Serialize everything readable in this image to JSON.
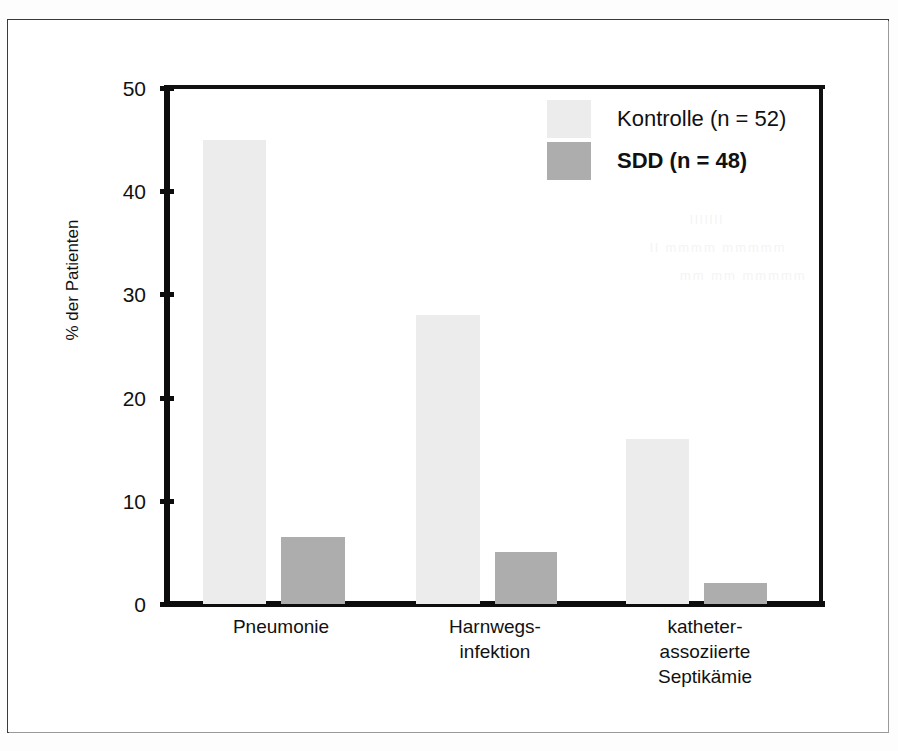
{
  "chart_data": {
    "type": "bar",
    "title": "",
    "xlabel": "",
    "ylabel": "% der Patienten",
    "ylim": [
      0,
      50
    ],
    "yticks": [
      0,
      10,
      20,
      30,
      40,
      50
    ],
    "ytick_labels": [
      "0",
      "10",
      "20",
      "30",
      "40",
      "50"
    ],
    "grid": false,
    "legend_position": "top-right",
    "categories": [
      "Pneumonie",
      "Harnwegs-\ninfektion",
      "katheter-\nassoziierte\nSeptikämie"
    ],
    "category_lines": [
      [
        "Pneumonie"
      ],
      [
        "Harnwegs-",
        "infektion"
      ],
      [
        "katheter-",
        "assoziierte",
        "Septikämie"
      ]
    ],
    "series": [
      {
        "name": "Kontrolle (n = 52)",
        "n": 52,
        "color": "#ececec",
        "bold": false,
        "values": [
          45,
          28,
          16
        ]
      },
      {
        "name": "SDD (n = 48)",
        "n": 48,
        "color": "#adadad",
        "bold": true,
        "values": [
          6.5,
          5,
          2
        ]
      }
    ]
  },
  "axis": {
    "y_title": "% der Patienten",
    "tick_0": "0",
    "tick_10": "10",
    "tick_20": "20",
    "tick_30": "30",
    "tick_40": "40",
    "tick_50": "50"
  },
  "legend": {
    "items": [
      {
        "label": "Kontrolle (n = 52)",
        "swatch": "kontrolle"
      },
      {
        "label": "SDD (n = 48)",
        "swatch": "sdd"
      }
    ]
  },
  "xlabels": {
    "g1_l1": "Pneumonie",
    "g2_l1": "Harnwegs-",
    "g2_l2": "infektion",
    "g3_l1": "katheter-",
    "g3_l2": "assoziierte",
    "g3_l3": "Septikämie"
  },
  "bars": {
    "g1_kontrolle": "45",
    "g1_sdd": "6.5",
    "g2_kontrolle": "28",
    "g2_sdd": "5",
    "g3_kontrolle": "16",
    "g3_sdd": "2"
  },
  "colors": {
    "kontrolle": "#ececec",
    "sdd": "#adadad",
    "axis": "#0d0d0d",
    "frame": "#3a3a3a"
  }
}
